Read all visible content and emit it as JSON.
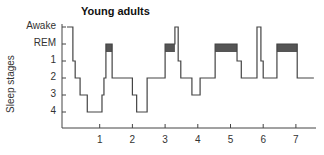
{
  "chart_data": {
    "type": "line",
    "subtype": "hypnogram (step plot)",
    "title": "Young adults",
    "xlabel": "",
    "ylabel": "Sleep stages",
    "x_ticks": [
      "1",
      "2",
      "3",
      "4",
      "5",
      "6",
      "7"
    ],
    "y_ticks": [
      "Awake",
      "REM",
      "1",
      "2",
      "3",
      "4"
    ],
    "xlim": [
      0,
      7.5
    ],
    "grid": false,
    "legend": null,
    "rem_fill_color": "#555555",
    "line_color": "#444444",
    "steps": [
      {
        "start": 0.0,
        "end": 0.18,
        "stage": "Awake"
      },
      {
        "start": 0.18,
        "end": 0.25,
        "stage": "1"
      },
      {
        "start": 0.25,
        "end": 0.4,
        "stage": "2"
      },
      {
        "start": 0.4,
        "end": 0.62,
        "stage": "3"
      },
      {
        "start": 0.62,
        "end": 1.07,
        "stage": "4"
      },
      {
        "start": 1.07,
        "end": 1.13,
        "stage": "3"
      },
      {
        "start": 1.13,
        "end": 1.19,
        "stage": "2"
      },
      {
        "start": 1.19,
        "end": 1.38,
        "stage": "REM"
      },
      {
        "start": 1.38,
        "end": 2.0,
        "stage": "2"
      },
      {
        "start": 2.0,
        "end": 2.13,
        "stage": "3"
      },
      {
        "start": 2.13,
        "end": 2.45,
        "stage": "4"
      },
      {
        "start": 2.45,
        "end": 3.0,
        "stage": "2"
      },
      {
        "start": 3.0,
        "end": 3.3,
        "stage": "REM"
      },
      {
        "start": 3.3,
        "end": 3.4,
        "stage": "Awake"
      },
      {
        "start": 3.4,
        "end": 3.48,
        "stage": "1"
      },
      {
        "start": 3.48,
        "end": 3.82,
        "stage": "2"
      },
      {
        "start": 3.82,
        "end": 4.07,
        "stage": "3"
      },
      {
        "start": 4.07,
        "end": 4.53,
        "stage": "2"
      },
      {
        "start": 4.53,
        "end": 5.2,
        "stage": "REM"
      },
      {
        "start": 5.2,
        "end": 5.33,
        "stage": "1"
      },
      {
        "start": 5.33,
        "end": 5.81,
        "stage": "2"
      },
      {
        "start": 5.81,
        "end": 5.93,
        "stage": "Awake"
      },
      {
        "start": 5.93,
        "end": 6.0,
        "stage": "1"
      },
      {
        "start": 6.0,
        "end": 6.42,
        "stage": "2"
      },
      {
        "start": 6.42,
        "end": 7.04,
        "stage": "REM"
      },
      {
        "start": 7.04,
        "end": 7.55,
        "stage": "2"
      }
    ]
  }
}
